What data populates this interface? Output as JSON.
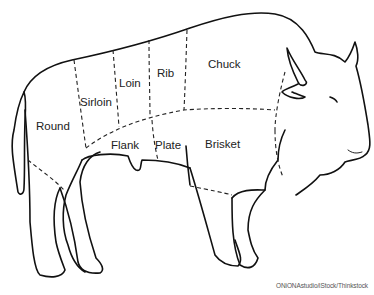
{
  "diagram": {
    "cuts": [
      {
        "id": "round",
        "label": "Round"
      },
      {
        "id": "sirloin",
        "label": "Sirloin"
      },
      {
        "id": "loin",
        "label": "Loin"
      },
      {
        "id": "rib",
        "label": "Rib"
      },
      {
        "id": "chuck",
        "label": "Chuck"
      },
      {
        "id": "flank",
        "label": "Flank"
      },
      {
        "id": "plate",
        "label": "Plate"
      },
      {
        "id": "brisket",
        "label": "Brisket"
      }
    ],
    "credit": "ONiONAstudio/iStock/Thinkstock"
  }
}
